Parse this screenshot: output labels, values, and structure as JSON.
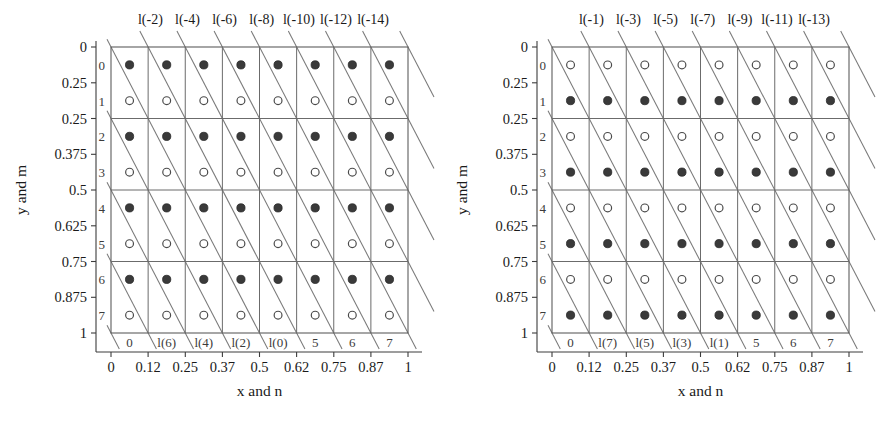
{
  "figure": {
    "panel_count": 2,
    "grid_columns": 8,
    "grid_rows": 8
  },
  "chart_data": {
    "type": "scatter",
    "title": "",
    "panels": [
      {
        "name": "left-panel",
        "xlabel": "x and n",
        "ylabel": "y and m",
        "xlim": [
          0,
          1
        ],
        "ylim": [
          0,
          1
        ],
        "grid": true,
        "x_ticks": [
          "0",
          "0.12",
          "0.25",
          "0.37",
          "0.5",
          "0.62",
          "0.75",
          "0.87",
          "1"
        ],
        "x_tick_values": [
          0,
          0.125,
          0.25,
          0.375,
          0.5,
          0.625,
          0.75,
          0.875,
          1
        ],
        "y_ticks": [
          "0",
          "0.25",
          "0.25",
          "0.375",
          "0.5",
          "0.625",
          "0.75",
          "0.875",
          "1"
        ],
        "y_tick_values": [
          0,
          0.125,
          0.25,
          0.375,
          0.5,
          0.625,
          0.75,
          0.875,
          1
        ],
        "row_indices": [
          "0",
          "1",
          "2",
          "3",
          "4",
          "5",
          "6",
          "7"
        ],
        "col_indices": [
          "0",
          "1",
          "2",
          "3",
          "4",
          "5",
          "6",
          "7"
        ],
        "bottom_inner_labels": [
          "0",
          "l(6)",
          "l(4)",
          "l(2)",
          "l(0)",
          "5",
          "6",
          "7"
        ],
        "top_labels": [
          "l(-2)",
          "l(-4)",
          "l(-6)",
          "l(-8)",
          "l(-10)",
          "l(-12)",
          "l(-14)"
        ],
        "marker_rows_filled": [
          0,
          2,
          4,
          6
        ],
        "marker_rows_open": [
          1,
          3,
          5,
          7
        ],
        "diagonal_line_count": 15,
        "diagonal_slope_rows_per_col": 2
      },
      {
        "name": "right-panel",
        "xlabel": "x and n",
        "ylabel": "y and m",
        "xlim": [
          0,
          1
        ],
        "ylim": [
          0,
          1
        ],
        "grid": true,
        "x_ticks": [
          "0",
          "0.12",
          "0.25",
          "0.37",
          "0.5",
          "0.62",
          "0.75",
          "0.87",
          "1"
        ],
        "x_tick_values": [
          0,
          0.125,
          0.25,
          0.375,
          0.5,
          0.625,
          0.75,
          0.875,
          1
        ],
        "y_ticks": [
          "0",
          "0.25",
          "0.25",
          "0.375",
          "0.5",
          "0.625",
          "0.75",
          "0.875",
          "1"
        ],
        "y_tick_values": [
          0,
          0.125,
          0.25,
          0.375,
          0.5,
          0.625,
          0.75,
          0.875,
          1
        ],
        "row_indices": [
          "0",
          "1",
          "2",
          "3",
          "4",
          "5",
          "6",
          "7"
        ],
        "col_indices": [
          "0",
          "1",
          "2",
          "3",
          "4",
          "5",
          "6",
          "7"
        ],
        "bottom_inner_labels": [
          "0",
          "l(7)",
          "l(5)",
          "l(3)",
          "l(1)",
          "5",
          "6",
          "7"
        ],
        "top_labels": [
          "l(-1)",
          "l(-3)",
          "l(-5)",
          "l(-7)",
          "l(-9)",
          "l(-11)",
          "l(-13)"
        ],
        "marker_rows_filled": [
          1,
          3,
          5,
          7
        ],
        "marker_rows_open": [
          0,
          2,
          4,
          6
        ],
        "diagonal_line_count": 15,
        "diagonal_slope_rows_per_col": 2
      }
    ]
  },
  "colors": {
    "frame": "#5d5d5d",
    "grid": "#6b6b6b",
    "diagonal": "#7a7a7a",
    "marker_filled": "#3a3a3a",
    "marker_open_stroke": "#4a4a4a",
    "background": "#ffffff",
    "text": "#1a1a1a"
  }
}
